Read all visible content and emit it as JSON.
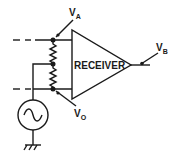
{
  "diagram": {
    "block": {
      "label": "RECEIVER"
    },
    "labels": {
      "va": {
        "main": "V",
        "sub": "A"
      },
      "vb": {
        "main": "V",
        "sub": "B"
      },
      "vo": {
        "main": "V",
        "sub": "O"
      }
    },
    "components": [
      "ac-source",
      "resistor-upper",
      "resistor-lower",
      "ground",
      "receiver-amplifier"
    ],
    "colors": {
      "stroke": "#1a1a1a",
      "background": "#ffffff"
    }
  }
}
